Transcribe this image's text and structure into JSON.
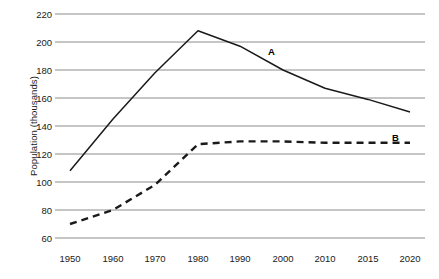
{
  "chart_data": {
    "type": "line",
    "title": "",
    "xlabel": "",
    "ylabel": "Population (thousands)",
    "xtick_labels": [
      "1950",
      "1960",
      "1970",
      "1980",
      "1990",
      "2000",
      "2010",
      "2015",
      "2020"
    ],
    "x": [
      1950,
      1960,
      1970,
      1980,
      1990,
      2000,
      2010,
      2015,
      2020
    ],
    "ytick_labels": [
      "220",
      "200",
      "180",
      "160",
      "140",
      "120",
      "100",
      "80",
      "60"
    ],
    "yticks": [
      220,
      200,
      180,
      160,
      140,
      120,
      100,
      80,
      60
    ],
    "ylim": [
      60,
      220
    ],
    "grid": "horizontal",
    "legend_position": "inline-labels",
    "series": [
      {
        "name": "A",
        "label": "A",
        "style": "solid",
        "color": "#1a1a1a",
        "values": [
          108,
          145,
          178,
          208,
          197,
          180,
          167,
          159,
          150
        ]
      },
      {
        "name": "B",
        "label": "B",
        "style": "dashed",
        "color": "#1a1a1a",
        "values": [
          70,
          80,
          98,
          127,
          129,
          129,
          128,
          128,
          128
        ]
      }
    ],
    "annotations": [
      {
        "text": "A",
        "series": "A",
        "x": 2000,
        "y": 200
      },
      {
        "text": "B",
        "series": "B",
        "x": 2015,
        "y": 135
      }
    ]
  },
  "axis": {
    "y_title": "Population (thousands)",
    "y_tick_0": "220",
    "y_tick_1": "200",
    "y_tick_2": "180",
    "y_tick_3": "160",
    "y_tick_4": "140",
    "y_tick_5": "120",
    "y_tick_6": "100",
    "y_tick_7": "80",
    "y_tick_8": "60",
    "x_tick_0": "1950",
    "x_tick_1": "1960",
    "x_tick_2": "1970",
    "x_tick_3": "1980",
    "x_tick_4": "1990",
    "x_tick_5": "2000",
    "x_tick_6": "2010",
    "x_tick_7": "2015",
    "x_tick_8": "2020"
  },
  "labels": {
    "series_a": "A",
    "series_b": "B"
  },
  "colors": {
    "line": "#1a1a1a",
    "grid": "#8c8c8c",
    "text": "#1a1a1a",
    "background": "#ffffff"
  }
}
